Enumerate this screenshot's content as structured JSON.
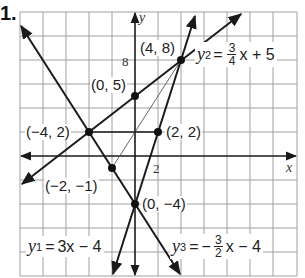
{
  "problem_number": "1.",
  "axes": {
    "x_label": "x",
    "y_label": "y",
    "x_tick_label": "2",
    "y_tick_label": "8",
    "grid_step_units": 2,
    "x_range": [
      -10,
      14
    ],
    "y_range": [
      -10,
      12
    ]
  },
  "lines": [
    {
      "name": "y1",
      "equation_lhs": "y",
      "subscript": "1",
      "equation_rhs": "3x − 4",
      "slope": 3,
      "intercept": -4
    },
    {
      "name": "y2",
      "equation_lhs": "y",
      "subscript": "2",
      "frac_num": "3",
      "frac_den": "4",
      "rhs_tail": "x + 5",
      "slope": 0.75,
      "intercept": 5
    },
    {
      "name": "y3",
      "equation_lhs": "y",
      "subscript": "3",
      "sign": "−",
      "frac_num": "3",
      "frac_den": "2",
      "rhs_tail": "x − 4",
      "slope": -1.5,
      "intercept": -4
    }
  ],
  "points": [
    {
      "label": "(4, 8)",
      "x": 4,
      "y": 8
    },
    {
      "label": "(0, 5)",
      "x": 0,
      "y": 5
    },
    {
      "label": "(−4, 2)",
      "x": -4,
      "y": 2
    },
    {
      "label": "(2, 2)",
      "x": 2,
      "y": 2
    },
    {
      "label": "(−2, −1)",
      "x": -2,
      "y": -1
    },
    {
      "label": "(0, −4)",
      "x": 0,
      "y": -4
    }
  ],
  "colors": {
    "line": "#1a1a1a",
    "grid": "#9a9a9a",
    "point": "#111111"
  }
}
